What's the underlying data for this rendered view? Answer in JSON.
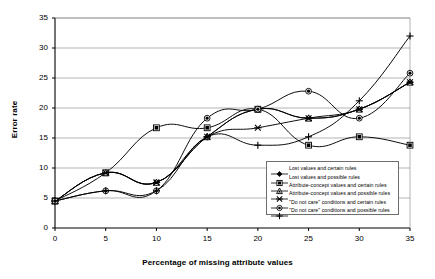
{
  "chart_data": {
    "type": "line",
    "title": "",
    "xlabel": "Percentage of missing attribute values",
    "ylabel": "Error rate",
    "x": [
      0,
      5,
      10,
      15,
      20,
      25,
      30,
      35
    ],
    "xlim": [
      0,
      35
    ],
    "ylim": [
      0,
      35
    ],
    "xticks": [
      "0",
      "5",
      "10",
      "15",
      "20",
      "25",
      "30",
      "35"
    ],
    "yticks": [
      "0",
      "5",
      "10",
      "15",
      "20",
      "25",
      "30",
      "35"
    ],
    "grid": "horizontal",
    "legend_position": "inside-lower-right",
    "series": [
      {
        "name": "Lost values and certain rules",
        "marker": "filled-diamond",
        "color": "#000000",
        "values": [
          4.5,
          9.2,
          7.6,
          15.2,
          19.8,
          18.3,
          19.8,
          24.3
        ]
      },
      {
        "name": "Lost values and possible rules",
        "marker": "open-square",
        "color": "#000000",
        "values": [
          4.5,
          9.2,
          16.7,
          16.7,
          19.8,
          13.8,
          15.2,
          13.8
        ]
      },
      {
        "name": "Attribute-concept values and certain rules",
        "marker": "open-triangle",
        "color": "#000000",
        "values": [
          4.5,
          9.2,
          7.6,
          15.2,
          19.8,
          18.3,
          19.8,
          24.3
        ]
      },
      {
        "name": "Attribute-concept values and possible rules",
        "marker": "cross-x",
        "color": "#000000",
        "values": [
          4.5,
          9.2,
          7.6,
          15.2,
          16.7,
          18.3,
          19.8,
          24.3
        ]
      },
      {
        "name": "\"Do not care\" conditions and certain rules",
        "marker": "open-circle",
        "color": "#000000",
        "values": [
          4.5,
          6.2,
          6.2,
          18.3,
          19.8,
          22.8,
          18.3,
          25.8
        ]
      },
      {
        "name": "\"Do not care\" conditions and possible rules",
        "marker": "plus",
        "color": "#000000",
        "values": [
          4.5,
          6.2,
          6.2,
          15.2,
          13.8,
          15.2,
          21.2,
          32.0
        ]
      }
    ]
  },
  "axes": {
    "x_title": "Percentage of missing attribute values",
    "y_title": "Error rate"
  },
  "legend": {
    "items": [
      {
        "label": "Lost values and certain rules"
      },
      {
        "label": "Lost values and possible rules"
      },
      {
        "label": "Attribute-concept values and certain rules"
      },
      {
        "label": "Attribute-concept values and possible rules"
      },
      {
        "label": "\"Do not care\" conditions and certain rules"
      },
      {
        "label": "\"Do not care\" conditions and possible rules"
      }
    ]
  },
  "style": {
    "grid_color": "#808080",
    "axis_color": "#000000",
    "series_color": "#000000",
    "background": "#ffffff"
  }
}
